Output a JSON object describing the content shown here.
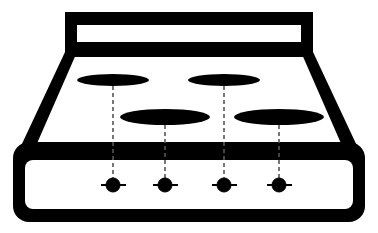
{
  "icon": {
    "name": "stove-cooktop-icon",
    "colors": {
      "foreground": "#000000",
      "background": "#ffffff"
    },
    "burners": [
      {
        "id": "back-left",
        "cx": 113,
        "cy": 80,
        "rx": 36,
        "ry": 6
      },
      {
        "id": "back-right",
        "cx": 224,
        "cy": 80,
        "rx": 36,
        "ry": 6
      },
      {
        "id": "front-left",
        "cx": 165,
        "cy": 117,
        "rx": 45,
        "ry": 8
      },
      {
        "id": "front-right",
        "cx": 279,
        "cy": 117,
        "rx": 45,
        "ry": 8
      }
    ],
    "knobs": [
      {
        "id": "knob-1",
        "cx": 113,
        "cy": 185
      },
      {
        "id": "knob-2",
        "cx": 165,
        "cy": 185
      },
      {
        "id": "knob-3",
        "cx": 224,
        "cy": 185
      },
      {
        "id": "knob-4",
        "cx": 279,
        "cy": 185
      }
    ]
  }
}
